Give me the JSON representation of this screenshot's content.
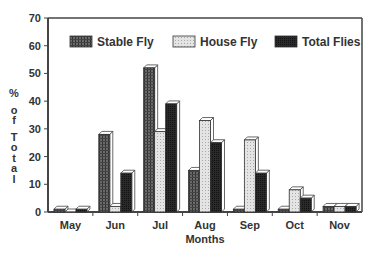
{
  "chart_data": {
    "type": "bar",
    "title": "",
    "xlabel": "Months",
    "ylabel": "% of Total",
    "ylim": [
      0,
      70
    ],
    "yticks": [
      0,
      10,
      20,
      30,
      40,
      50,
      60,
      70
    ],
    "grid": false,
    "legend_position": "top-inside",
    "categories": [
      "May",
      "Jun",
      "Jul",
      "Aug",
      "Sep",
      "Oct",
      "Nov"
    ],
    "series": [
      {
        "name": "Stable Fly",
        "pattern": "dark-grid",
        "values": [
          1,
          28,
          52,
          15,
          1,
          1,
          2
        ]
      },
      {
        "name": "House Fly",
        "pattern": "light-stipple",
        "values": [
          0,
          2,
          29,
          33,
          26,
          8,
          2
        ]
      },
      {
        "name": "Total Flies",
        "pattern": "solid-dark",
        "values": [
          1,
          14,
          39,
          25,
          14,
          5,
          2
        ]
      }
    ]
  },
  "colors": {
    "stable": "#555555",
    "house": "#d8d8d8",
    "total": "#222222",
    "axis": "#444444"
  }
}
